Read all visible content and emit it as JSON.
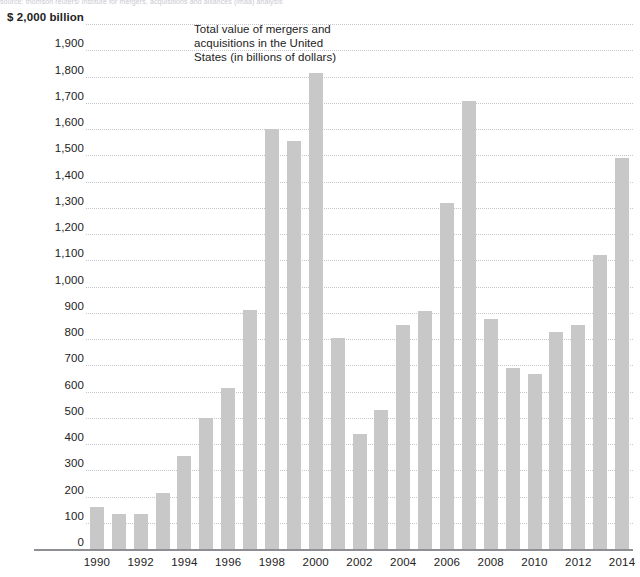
{
  "source_note": "source: thomson reuters/ institute for mergers, acquisitions and alliances (imaa) analysis",
  "annotation": "Total value of mergers and acquisitions in the United States (in billions of dollars)",
  "axis": {
    "y_top_label": "$ 2,000 billion",
    "y_ticks": [
      "$ 2,000 billion",
      "1,900",
      "1,800",
      "1,700",
      "1,600",
      "1,500",
      "1,400",
      "1,300",
      "1,200",
      "1,100",
      "1,000",
      "900",
      "800",
      "700",
      "600",
      "500",
      "400",
      "300",
      "200",
      "100",
      "0"
    ],
    "x_ticks": [
      "1990",
      "1992",
      "1994",
      "1996",
      "1998",
      "2000",
      "2002",
      "2004",
      "2006",
      "2008",
      "2010",
      "2012",
      "2014"
    ]
  },
  "colors": {
    "bar": "#c8c8c8",
    "gridline": "#c5c5cb",
    "baseline": "#8e8e93",
    "text": "#222222"
  },
  "chart_data": {
    "type": "bar",
    "title": "Total value of mergers and acquisitions in the United States (in billions of dollars)",
    "xlabel": "",
    "ylabel": "$ 2,000 billion",
    "ylim": [
      0,
      2000
    ],
    "grid": true,
    "legend": "none",
    "categories": [
      "1990",
      "1991",
      "1992",
      "1993",
      "1994",
      "1995",
      "1996",
      "1997",
      "1998",
      "1999",
      "2000",
      "2001",
      "2002",
      "2003",
      "2004",
      "2005",
      "2006",
      "2007",
      "2008",
      "2009",
      "2010",
      "2011",
      "2012",
      "2013",
      "2014"
    ],
    "values": [
      160,
      135,
      135,
      215,
      355,
      500,
      615,
      910,
      1600,
      1555,
      1815,
      805,
      440,
      530,
      855,
      905,
      1320,
      1705,
      875,
      690,
      665,
      825,
      855,
      1120,
      1490
    ],
    "y_tick_values": [
      0,
      100,
      200,
      300,
      400,
      500,
      600,
      700,
      800,
      900,
      1000,
      1100,
      1200,
      1300,
      1400,
      1500,
      1600,
      1700,
      1800,
      1900,
      2000
    ],
    "x_tick_values": [
      "1990",
      "1992",
      "1994",
      "1996",
      "1998",
      "2000",
      "2002",
      "2004",
      "2006",
      "2008",
      "2010",
      "2012",
      "2014"
    ]
  }
}
